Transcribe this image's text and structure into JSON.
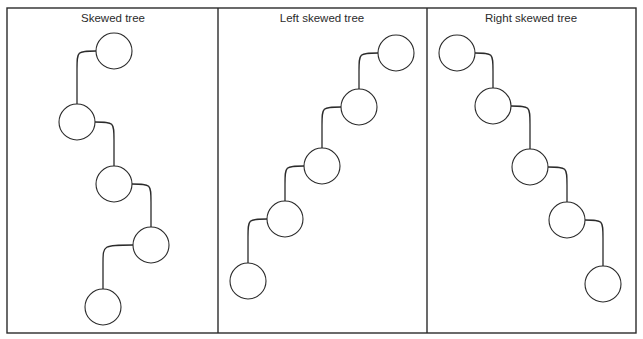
{
  "figure": {
    "width": 643,
    "height": 339,
    "stroke_color": "#2b2b2b",
    "background": "#ffffff",
    "frame": {
      "x1": 7,
      "y1": 8,
      "x2": 636,
      "y2": 333
    },
    "dividers": [
      218,
      427
    ],
    "node_radius": 18
  },
  "panels": [
    {
      "title": "Skewed tree",
      "title_x": 113,
      "nodes": [
        {
          "cx": 114,
          "cy": 51
        },
        {
          "cx": 77,
          "cy": 122
        },
        {
          "cx": 114,
          "cy": 184
        },
        {
          "cx": 151,
          "cy": 245
        },
        {
          "cx": 103,
          "cy": 307
        }
      ]
    },
    {
      "title": "Left skewed tree",
      "title_x": 322,
      "nodes": [
        {
          "cx": 396,
          "cy": 53
        },
        {
          "cx": 359,
          "cy": 107
        },
        {
          "cx": 322,
          "cy": 166
        },
        {
          "cx": 285,
          "cy": 219
        },
        {
          "cx": 248,
          "cy": 281
        }
      ]
    },
    {
      "title": "Right skewed tree",
      "title_x": 531,
      "nodes": [
        {
          "cx": 457,
          "cy": 53
        },
        {
          "cx": 493,
          "cy": 106
        },
        {
          "cx": 530,
          "cy": 167
        },
        {
          "cx": 567,
          "cy": 220
        },
        {
          "cx": 603,
          "cy": 284
        }
      ]
    }
  ]
}
